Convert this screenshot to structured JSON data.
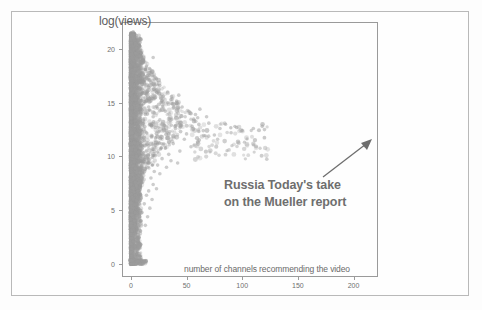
{
  "figure": {
    "y_axis_label": "log(views)",
    "x_axis_label": "number of channels recommending the video",
    "annotation_line1": "Russia Today's take",
    "annotation_line2": "on the Mueller report",
    "point_color": "#9b9b9b",
    "text_color": "#6e6e6e",
    "frame_color": "#9a9a9a",
    "background_color": "#fefefe"
  },
  "chart_data": {
    "type": "scatter",
    "title": "",
    "xlabel": "number of channels recommending the video",
    "ylabel": "log(views)",
    "xlim": [
      -8,
      222
    ],
    "ylim": [
      -1.2,
      22.5
    ],
    "xticks": [
      0,
      50,
      100,
      150,
      200
    ],
    "yticks": [
      0,
      5,
      10,
      15,
      20
    ],
    "grid": false,
    "legend": null,
    "marker_color": "#9b9b9b",
    "marker_alpha": 0.45,
    "annotations": [
      {
        "text": "Russia Today's take on the Mueller report",
        "target_x": 210,
        "target_y": 11.0,
        "text_x": 95,
        "text_y": 7.8,
        "arrow": true,
        "bold": true
      }
    ],
    "points": [
      [
        0,
        0.0
      ],
      [
        0,
        0.0
      ],
      [
        0,
        0.0
      ],
      [
        1,
        0.0
      ],
      [
        1,
        0.0
      ],
      [
        2,
        0.0
      ],
      [
        3,
        0.0
      ],
      [
        5,
        0.0
      ],
      [
        8,
        0.0
      ],
      [
        11,
        0.0
      ],
      [
        0,
        0.7
      ],
      [
        1,
        0.8
      ],
      [
        0,
        1.1
      ],
      [
        1,
        1.4
      ],
      [
        0,
        1.9
      ],
      [
        2,
        2.1
      ],
      [
        1,
        2.4
      ],
      [
        0,
        2.8
      ],
      [
        1,
        3.1
      ],
      [
        2,
        3.3
      ],
      [
        0,
        3.6
      ],
      [
        1,
        3.8
      ],
      [
        3,
        4.0
      ],
      [
        0,
        4.2
      ],
      [
        2,
        4.4
      ],
      [
        1,
        4.6
      ],
      [
        4,
        4.8
      ],
      [
        0,
        5.0
      ],
      [
        2,
        5.2
      ],
      [
        1,
        5.3
      ],
      [
        3,
        5.5
      ],
      [
        0,
        5.7
      ],
      [
        5,
        5.9
      ],
      [
        2,
        6.0
      ],
      [
        1,
        6.2
      ],
      [
        4,
        6.4
      ],
      [
        0,
        6.5
      ],
      [
        3,
        6.7
      ],
      [
        6,
        6.8
      ],
      [
        2,
        7.0
      ],
      [
        1,
        7.1
      ],
      [
        5,
        7.3
      ],
      [
        0,
        7.4
      ],
      [
        4,
        7.6
      ],
      [
        8,
        7.7
      ],
      [
        2,
        7.9
      ],
      [
        3,
        8.0
      ],
      [
        7,
        8.2
      ],
      [
        1,
        8.3
      ],
      [
        5,
        8.5
      ],
      [
        0,
        8.6
      ],
      [
        9,
        8.8
      ],
      [
        4,
        8.9
      ],
      [
        2,
        9.1
      ],
      [
        6,
        9.2
      ],
      [
        11,
        9.4
      ],
      [
        3,
        9.5
      ],
      [
        8,
        9.7
      ],
      [
        1,
        9.8
      ],
      [
        5,
        10.0
      ],
      [
        13,
        10.1
      ],
      [
        0,
        10.3
      ],
      [
        7,
        10.4
      ],
      [
        4,
        10.6
      ],
      [
        10,
        10.7
      ],
      [
        2,
        10.9
      ],
      [
        16,
        11.0
      ],
      [
        6,
        11.2
      ],
      [
        3,
        11.3
      ],
      [
        12,
        11.5
      ],
      [
        8,
        11.6
      ],
      [
        1,
        11.8
      ],
      [
        19,
        11.9
      ],
      [
        5,
        12.1
      ],
      [
        14,
        12.2
      ],
      [
        9,
        12.4
      ],
      [
        3,
        12.5
      ],
      [
        22,
        12.7
      ],
      [
        7,
        12.8
      ],
      [
        17,
        13.0
      ],
      [
        11,
        13.1
      ],
      [
        4,
        13.3
      ],
      [
        26,
        13.4
      ],
      [
        8,
        13.6
      ],
      [
        20,
        13.7
      ],
      [
        13,
        13.9
      ],
      [
        5,
        14.0
      ],
      [
        31,
        14.2
      ],
      [
        10,
        14.3
      ],
      [
        24,
        14.5
      ],
      [
        16,
        14.6
      ],
      [
        6,
        14.8
      ],
      [
        37,
        14.9
      ],
      [
        12,
        15.1
      ],
      [
        28,
        15.2
      ],
      [
        19,
        15.4
      ],
      [
        7,
        15.5
      ],
      [
        43,
        15.7
      ],
      [
        14,
        15.8
      ],
      [
        33,
        16.0
      ],
      [
        22,
        16.1
      ],
      [
        8,
        16.3
      ],
      [
        16,
        16.4
      ],
      [
        26,
        16.6
      ],
      [
        10,
        16.7
      ],
      [
        18,
        16.9
      ],
      [
        12,
        17.0
      ],
      [
        21,
        17.2
      ],
      [
        9,
        17.3
      ],
      [
        15,
        17.5
      ],
      [
        11,
        17.6
      ],
      [
        17,
        17.8
      ],
      [
        7,
        17.9
      ],
      [
        13,
        18.1
      ],
      [
        9,
        18.2
      ],
      [
        14,
        18.4
      ],
      [
        6,
        18.5
      ],
      [
        10,
        18.7
      ],
      [
        8,
        18.8
      ],
      [
        11,
        19.0
      ],
      [
        5,
        19.1
      ],
      [
        9,
        19.3
      ],
      [
        7,
        19.4
      ],
      [
        20,
        19.2
      ],
      [
        4,
        19.6
      ],
      [
        6,
        19.8
      ],
      [
        3,
        19.9
      ],
      [
        5,
        20.1
      ],
      [
        2,
        20.3
      ],
      [
        4,
        20.5
      ],
      [
        1,
        20.6
      ],
      [
        3,
        20.8
      ],
      [
        2,
        21.0
      ],
      [
        1,
        21.2
      ],
      [
        2,
        21.6
      ],
      [
        30,
        12.9
      ],
      [
        35,
        12.3
      ],
      [
        40,
        12.6
      ],
      [
        45,
        13.2
      ],
      [
        50,
        12.1
      ],
      [
        55,
        12.8
      ],
      [
        60,
        13.6
      ],
      [
        65,
        12.4
      ],
      [
        70,
        13.1
      ],
      [
        75,
        12.0
      ],
      [
        80,
        12.6
      ],
      [
        85,
        13.0
      ],
      [
        90,
        12.2
      ],
      [
        95,
        12.7
      ],
      [
        100,
        12.4
      ],
      [
        110,
        12.6
      ],
      [
        118,
        12.8
      ],
      [
        120,
        12.5
      ],
      [
        46,
        14.6
      ],
      [
        52,
        14.2
      ],
      [
        58,
        13.9
      ],
      [
        62,
        14.4
      ],
      [
        68,
        13.7
      ],
      [
        36,
        15.3
      ],
      [
        41,
        14.9
      ],
      [
        29,
        15.6
      ],
      [
        33,
        15.0
      ],
      [
        25,
        16.0
      ],
      [
        27,
        15.4
      ],
      [
        23,
        16.2
      ],
      [
        31,
        10.8
      ],
      [
        38,
        11.2
      ],
      [
        44,
        10.5
      ],
      [
        48,
        11.6
      ],
      [
        54,
        10.9
      ],
      [
        28,
        9.8
      ],
      [
        34,
        10.2
      ],
      [
        24,
        9.2
      ],
      [
        21,
        8.6
      ],
      [
        18,
        8.0
      ],
      [
        26,
        8.4
      ],
      [
        32,
        9.0
      ],
      [
        20,
        7.4
      ],
      [
        16,
        6.8
      ],
      [
        23,
        7.0
      ],
      [
        14,
        6.4
      ],
      [
        19,
        6.0
      ],
      [
        12,
        5.6
      ],
      [
        17,
        5.2
      ],
      [
        10,
        4.8
      ],
      [
        15,
        4.4
      ],
      [
        9,
        4.0
      ],
      [
        13,
        3.6
      ],
      [
        36,
        9.6
      ],
      [
        42,
        9.4
      ],
      [
        210,
        11.0
      ]
    ]
  }
}
